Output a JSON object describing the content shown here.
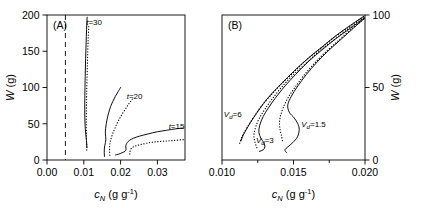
{
  "figure": {
    "background": "#ffffff",
    "ink": "#000000",
    "width": 423,
    "height": 208
  },
  "chart_data": [
    {
      "type": "line",
      "panel": "A",
      "panel_label": "(A)",
      "title": "",
      "xlabel": "c_N (g g^-1)",
      "ylabel": "W (g)",
      "xlim": [
        0.0,
        0.0375
      ],
      "ylim": [
        0,
        200
      ],
      "xticks": [
        0.0,
        0.01,
        0.02,
        0.03
      ],
      "xtick_labels": [
        "0.00",
        "0.01",
        "0.02",
        "0.03"
      ],
      "yticks": [
        0,
        50,
        100,
        150,
        200
      ],
      "ytick_labels": [
        "0",
        "50",
        "100",
        "150",
        "200"
      ],
      "grid": false,
      "legend": "inline-annotations",
      "annotations": [
        {
          "text": "t=30",
          "x": 0.0128,
          "y": 186
        },
        {
          "text": "t=20",
          "x": 0.0238,
          "y": 84
        },
        {
          "text": "t=15",
          "x": 0.0352,
          "y": 43
        }
      ],
      "reference_line": {
        "orientation": "vertical",
        "x": 0.005,
        "style": "dashed"
      },
      "series": [
        {
          "name": "t=30 solid",
          "style": "solid",
          "points": [
            [
              0.0109,
              197
            ],
            [
              0.01075,
              180
            ],
            [
              0.01062,
              160
            ],
            [
              0.0105,
              140
            ],
            [
              0.0104,
              120
            ],
            [
              0.01032,
              100
            ],
            [
              0.01028,
              85
            ],
            [
              0.01026,
              70
            ],
            [
              0.01028,
              58
            ],
            [
              0.01035,
              48
            ],
            [
              0.01046,
              40
            ],
            [
              0.0106,
              33
            ],
            [
              0.01072,
              27
            ],
            [
              0.0108,
              22
            ],
            [
              0.01085,
              17
            ]
          ]
        },
        {
          "name": "t=30 dotted",
          "style": "dotted",
          "points": [
            [
              0.01135,
              184
            ],
            [
              0.0112,
              168
            ],
            [
              0.01108,
              150
            ],
            [
              0.01096,
              130
            ],
            [
              0.01086,
              110
            ],
            [
              0.01078,
              92
            ],
            [
              0.01072,
              76
            ],
            [
              0.01068,
              62
            ],
            [
              0.01066,
              50
            ],
            [
              0.01067,
              40
            ],
            [
              0.0107,
              32
            ],
            [
              0.01074,
              25
            ],
            [
              0.01078,
              18
            ],
            [
              0.01082,
              12
            ]
          ]
        },
        {
          "name": "t=20 solid",
          "style": "solid",
          "points": [
            [
              0.02,
              100
            ],
            [
              0.0193,
              94
            ],
            [
              0.0186,
              88
            ],
            [
              0.0179,
              81
            ],
            [
              0.0173,
              74
            ],
            [
              0.0168,
              66
            ],
            [
              0.0164,
              58
            ],
            [
              0.0161,
              50
            ],
            [
              0.01592,
              43
            ],
            [
              0.01586,
              37
            ],
            [
              0.01594,
              32
            ],
            [
              0.016,
              28
            ],
            [
              0.01588,
              24
            ],
            [
              0.0157,
              20
            ],
            [
              0.01558,
              15
            ],
            [
              0.01556,
              10
            ],
            [
              0.01562,
              5
            ]
          ]
        },
        {
          "name": "t=20 dotted",
          "style": "dotted",
          "points": [
            [
              0.0232,
              84
            ],
            [
              0.0223,
              78
            ],
            [
              0.0214,
              71
            ],
            [
              0.0205,
              64
            ],
            [
              0.0197,
              57
            ],
            [
              0.019,
              50
            ],
            [
              0.0184,
              43
            ],
            [
              0.0179,
              37
            ],
            [
              0.0175,
              31
            ],
            [
              0.01722,
              26
            ],
            [
              0.01706,
              21
            ],
            [
              0.017,
              16
            ],
            [
              0.01702,
              11
            ],
            [
              0.01706,
              6
            ]
          ]
        },
        {
          "name": "t=15 solid",
          "style": "solid",
          "points": [
            [
              0.037,
              44
            ],
            [
              0.035,
              43
            ],
            [
              0.0325,
              41
            ],
            [
              0.03,
              39
            ],
            [
              0.0275,
              36
            ],
            [
              0.0252,
              33
            ],
            [
              0.0235,
              30
            ],
            [
              0.0224,
              27
            ],
            [
              0.0218,
              24
            ],
            [
              0.0215,
              21
            ],
            [
              0.0214,
              18
            ],
            [
              0.0215,
              15
            ],
            [
              0.0212,
              12
            ],
            [
              0.0204,
              10
            ],
            [
              0.0194,
              8
            ],
            [
              0.0186,
              7
            ]
          ]
        },
        {
          "name": "t=15 dotted",
          "style": "dotted",
          "points": [
            [
              0.037,
              28
            ],
            [
              0.0345,
              27
            ],
            [
              0.0318,
              26
            ],
            [
              0.0293,
              25
            ],
            [
              0.027,
              23
            ],
            [
              0.0252,
              21
            ],
            [
              0.0239,
              19
            ],
            [
              0.0231,
              17
            ],
            [
              0.0227,
              14
            ],
            [
              0.02255,
              11
            ],
            [
              0.0225,
              8
            ],
            [
              0.02248,
              5
            ]
          ]
        }
      ]
    },
    {
      "type": "line",
      "panel": "B",
      "panel_label": "(B)",
      "title": "",
      "xlabel": "c_N (g g^-1)",
      "ylabel": "W (g)",
      "xlim": [
        0.01,
        0.02
      ],
      "ylim": [
        0,
        100
      ],
      "xticks": [
        0.01,
        0.0125,
        0.015,
        0.0175,
        0.02
      ],
      "xtick_labels": [
        "0.010",
        "",
        "0.015",
        "",
        "0.020"
      ],
      "yticks": [
        0,
        50,
        100
      ],
      "ytick_labels": [
        "0",
        "50",
        "100"
      ],
      "y_axis_side": "right",
      "grid": false,
      "legend": "inline-annotations",
      "annotations": [
        {
          "text": "Vd=6",
          "x": 0.01075,
          "y": 30
        },
        {
          "text": "Vd=3",
          "x": 0.013,
          "y": 12
        },
        {
          "text": "Vd=1.5",
          "x": 0.0164,
          "y": 23
        }
      ],
      "series": [
        {
          "name": "Vd=6 solid",
          "style": "solid",
          "points": [
            [
              0.0199,
              99
            ],
            [
              0.019,
              93
            ],
            [
              0.018,
              86
            ],
            [
              0.017,
              78
            ],
            [
              0.016,
              70
            ],
            [
              0.015,
              61
            ],
            [
              0.0142,
              53
            ],
            [
              0.0135,
              46
            ],
            [
              0.0129,
              39
            ],
            [
              0.0124,
              32
            ],
            [
              0.012,
              26
            ],
            [
              0.0117,
              21
            ],
            [
              0.01148,
              17
            ],
            [
              0.01132,
              13
            ]
          ]
        },
        {
          "name": "Vd=6 dotted",
          "style": "dotted",
          "points": [
            [
              0.0199,
              99
            ],
            [
              0.0189,
              92
            ],
            [
              0.0179,
              85
            ],
            [
              0.0169,
              77
            ],
            [
              0.0159,
              69
            ],
            [
              0.01495,
              60
            ],
            [
              0.0141,
              52
            ],
            [
              0.01335,
              44
            ],
            [
              0.01275,
              37
            ],
            [
              0.01225,
              30
            ],
            [
              0.01185,
              24
            ],
            [
              0.01155,
              19
            ],
            [
              0.01135,
              15
            ],
            [
              0.01122,
              11
            ]
          ]
        },
        {
          "name": "Vd=3 solid",
          "style": "solid",
          "points": [
            [
              0.01995,
              98
            ],
            [
              0.019,
              91
            ],
            [
              0.018,
              84
            ],
            [
              0.017,
              76
            ],
            [
              0.01605,
              68
            ],
            [
              0.01515,
              59
            ],
            [
              0.0144,
              51
            ],
            [
              0.01375,
              43
            ],
            [
              0.01325,
              36
            ],
            [
              0.01288,
              30
            ],
            [
              0.01264,
              24
            ],
            [
              0.01258,
              19
            ],
            [
              0.01272,
              15
            ],
            [
              0.01292,
              12
            ],
            [
              0.013,
              9
            ],
            [
              0.01288,
              7
            ],
            [
              0.01262,
              6
            ]
          ]
        },
        {
          "name": "Vd=3 dotted",
          "style": "dotted",
          "points": [
            [
              0.0199,
              98
            ],
            [
              0.0189,
              91
            ],
            [
              0.01785,
              83
            ],
            [
              0.0168,
              75
            ],
            [
              0.0158,
              66
            ],
            [
              0.0149,
              58
            ],
            [
              0.01415,
              50
            ],
            [
              0.0135,
              42
            ],
            [
              0.013,
              35
            ],
            [
              0.01262,
              29
            ],
            [
              0.01236,
              23
            ],
            [
              0.01224,
              18
            ],
            [
              0.01226,
              14
            ],
            [
              0.01238,
              10
            ],
            [
              0.0125,
              7
            ]
          ]
        },
        {
          "name": "Vd=1.5 solid",
          "style": "solid",
          "points": [
            [
              0.02,
              98
            ],
            [
              0.0192,
              91
            ],
            [
              0.0183,
              83
            ],
            [
              0.0174,
              75
            ],
            [
              0.0166,
              67
            ],
            [
              0.0159,
              59
            ],
            [
              0.0153,
              51
            ],
            [
              0.01485,
              44
            ],
            [
              0.0146,
              38
            ],
            [
              0.0147,
              33
            ],
            [
              0.01505,
              29
            ],
            [
              0.0153,
              25
            ],
            [
              0.0154,
              21
            ],
            [
              0.01528,
              16
            ],
            [
              0.01495,
              12
            ],
            [
              0.0146,
              9
            ],
            [
              0.0144,
              7
            ],
            [
              0.01452,
              5
            ]
          ]
        },
        {
          "name": "Vd=1.5 dotted",
          "style": "dotted",
          "points": [
            [
              0.0199,
              97
            ],
            [
              0.019,
              90
            ],
            [
              0.0181,
              82
            ],
            [
              0.0172,
              74
            ],
            [
              0.0164,
              66
            ],
            [
              0.0157,
              58
            ],
            [
              0.0151,
              50
            ],
            [
              0.01462,
              43
            ],
            [
              0.01428,
              36
            ],
            [
              0.01408,
              30
            ],
            [
              0.01402,
              25
            ],
            [
              0.01408,
              20
            ],
            [
              0.01418,
              16
            ],
            [
              0.01424,
              12
            ]
          ]
        }
      ]
    }
  ],
  "panelA": {
    "label": "(A)",
    "ylabel_italic": "W",
    "ylabel_unit": "(g)",
    "xlabel_main": "c",
    "xlabel_sub": "N",
    "xlabel_unit": "(g g",
    "xlabel_sup": "-1",
    "xlabel_close": ")",
    "xtick_labels": [
      "0.00",
      "0.01",
      "0.02",
      "0.03"
    ],
    "ytick_labels": [
      "0",
      "50",
      "100",
      "150",
      "200"
    ],
    "curve_labels": [
      "t=30",
      "t=20",
      "t=15"
    ]
  },
  "panelB": {
    "label": "(B)",
    "ylabel_italic": "W",
    "ylabel_unit": "(g)",
    "xlabel_main": "c",
    "xlabel_sub": "N",
    "xlabel_unit": "(g g",
    "xlabel_sup": "-1",
    "xlabel_close": ")",
    "xtick_labels": [
      "0.010",
      "0.015",
      "0.020"
    ],
    "ytick_labels": [
      "0",
      "50",
      "100"
    ],
    "curve_labels": [
      "Vd=6",
      "Vd=3",
      "Vd=1.5"
    ]
  }
}
